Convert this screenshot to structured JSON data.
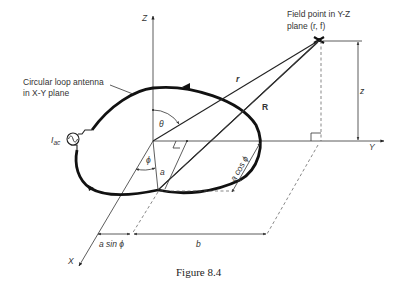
{
  "figure": {
    "caption": "Figure 8.4",
    "axes": {
      "z": "Z",
      "y": "Y",
      "x": "X"
    },
    "labels": {
      "loop_line1": "Circular loop antenna",
      "loop_line2": "in X-Y plane",
      "field_line1": "Field point in Y-Z",
      "field_line2": "plane (r, f)",
      "source": "I",
      "source_sub": "ac",
      "r_vec": "r",
      "R_vec": "R",
      "theta": "θ",
      "phi": "ϕ",
      "a": "a",
      "z_dim": "z",
      "a_cos_phi": "a cos ϕ",
      "a_sin_phi": "a sin ϕ",
      "b": "b"
    },
    "colors": {
      "ink": "#222222",
      "background": "#ffffff"
    }
  }
}
